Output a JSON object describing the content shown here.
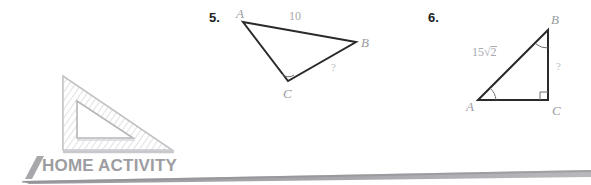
{
  "page": {
    "width": 591,
    "height": 185,
    "background": "#ffffff"
  },
  "problems": [
    {
      "number": "5.",
      "figure": "scalene-triangle",
      "vertices": [
        {
          "name": "A",
          "label": "A",
          "x": 243,
          "y": 22
        },
        {
          "name": "B",
          "label": "B",
          "x": 356,
          "y": 42
        },
        {
          "name": "C",
          "label": "C",
          "x": 288,
          "y": 81
        }
      ],
      "side_labels": [
        {
          "for": "AB",
          "text": "10"
        },
        {
          "for": "BC",
          "text": "?"
        }
      ],
      "angle_marks": [
        {
          "at": "C",
          "type": "arc"
        }
      ]
    },
    {
      "number": "6.",
      "figure": "right-triangle",
      "vertices": [
        {
          "name": "A",
          "label": "A",
          "x": 478,
          "y": 100
        },
        {
          "name": "B",
          "label": "B",
          "x": 548,
          "y": 30
        },
        {
          "name": "C",
          "label": "C",
          "x": 548,
          "y": 100
        }
      ],
      "side_labels": [
        {
          "for": "AB",
          "text": "15",
          "radicand": "2"
        },
        {
          "for": "BC",
          "text": "?"
        }
      ],
      "angle_marks": [
        {
          "at": "A",
          "type": "arc"
        },
        {
          "at": "B",
          "type": "arc"
        },
        {
          "at": "C",
          "type": "right-angle"
        }
      ]
    }
  ],
  "home_activity": {
    "title": "HOME ACTIVITY",
    "icon": "set-square-triangle-ruler-icon",
    "accent_color": "#9d9da1",
    "bar_color": "#a6a6aa"
  },
  "colors": {
    "ink": "#1d1d1f",
    "stroke": "#2a2a2c",
    "muted": "#9a9a9e",
    "faint": "#bcbcc0",
    "banner": "#9d9da1"
  }
}
